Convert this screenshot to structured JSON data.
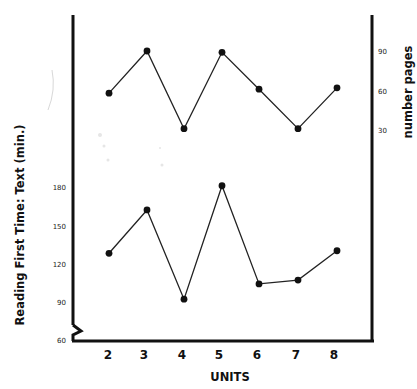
{
  "chart_data": [
    {
      "type": "line",
      "title": "",
      "xlabel": "UNITS",
      "ylabel": "number pages",
      "y_axis_side": "right",
      "categories": [
        "2",
        "3",
        "4",
        "5",
        "6",
        "7",
        "8"
      ],
      "x": [
        2,
        3,
        4,
        5,
        6,
        7,
        8
      ],
      "series": [
        {
          "name": "number pages",
          "values": [
            58,
            90,
            31,
            89,
            61,
            31,
            62
          ]
        }
      ],
      "yticks": [
        30,
        60,
        90
      ],
      "grid": false,
      "legend": "none"
    },
    {
      "type": "line",
      "title": "",
      "xlabel": "UNITS",
      "ylabel": "Reading First Time: Text (min.)",
      "y_axis_side": "left",
      "categories": [
        "2",
        "3",
        "4",
        "5",
        "6",
        "7",
        "8"
      ],
      "x": [
        2,
        3,
        4,
        5,
        6,
        7,
        8
      ],
      "series": [
        {
          "name": "Reading First Time: Text (min.)",
          "values": [
            128,
            162,
            92,
            181,
            104,
            107,
            130
          ]
        }
      ],
      "yticks": [
        60,
        90,
        120,
        150,
        180
      ],
      "ylim": [
        60,
        190
      ],
      "axis_break": true,
      "grid": false,
      "legend": "none"
    }
  ],
  "labels": {
    "x_axis": "UNITS",
    "left_axis": "Reading First Time: Text (min.)",
    "right_axis": "number pages",
    "x_ticks": [
      "2",
      "3",
      "4",
      "5",
      "6",
      "7",
      "8"
    ],
    "left_ticks": [
      "60",
      "90",
      "120",
      "150",
      "180"
    ],
    "right_ticks": [
      "30",
      "60",
      "90"
    ]
  }
}
